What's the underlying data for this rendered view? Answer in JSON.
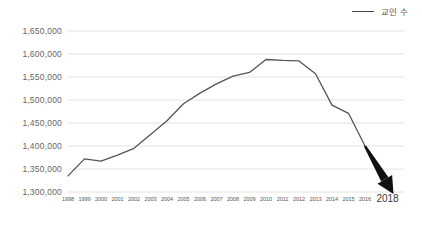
{
  "legend": {
    "label": "교인 수",
    "line_color": "#4a4a4a"
  },
  "axis": {
    "y_ticks": [
      "1,650,000",
      "1,600,000",
      "1,550,000",
      "1,500,000",
      "1,450,000",
      "1,400,000",
      "1,350,000",
      "1,300,000"
    ],
    "x_ticks": [
      "1998",
      "1999",
      "2000",
      "2001",
      "2002",
      "2003",
      "2004",
      "2005",
      "2006",
      "2007",
      "2008",
      "2009",
      "2010",
      "2011",
      "2012",
      "2013",
      "2014",
      "2015",
      "2016"
    ],
    "x_tick_emphasis": "2018"
  },
  "annotation": {
    "arrow_color": "#111111",
    "arrow_meaning": "projected-decline-arrow"
  },
  "colors": {
    "background": "#ffffff",
    "gridline": "#e2e2e2",
    "series_line": "#555555",
    "tick_text": "#666666"
  },
  "chart_data": {
    "type": "line",
    "title": "",
    "xlabel": "",
    "ylabel": "",
    "ylim": [
      1300000,
      1650000
    ],
    "ytick_step": 50000,
    "grid": true,
    "legend_position": "top-right",
    "categories": [
      "1998",
      "1999",
      "2000",
      "2001",
      "2002",
      "2003",
      "2004",
      "2005",
      "2006",
      "2007",
      "2008",
      "2009",
      "2010",
      "2011",
      "2012",
      "2013",
      "2014",
      "2015",
      "2016"
    ],
    "series": [
      {
        "name": "교인 수",
        "values": [
          1335000,
          1372000,
          1367000,
          1380000,
          1395000,
          1425000,
          1455000,
          1492000,
          1515000,
          1535000,
          1552000,
          1560000,
          1588000,
          1586000,
          1585000,
          1557000,
          1489000,
          1471000,
          1400000
        ]
      }
    ],
    "annotations": [
      {
        "type": "arrow",
        "label": "2018",
        "from": {
          "x": "2016",
          "y": 1400000
        },
        "to": {
          "x": "2018",
          "y": 1300000
        }
      }
    ]
  }
}
